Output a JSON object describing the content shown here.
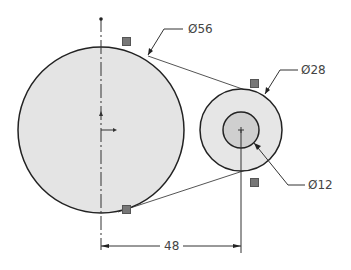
{
  "drawing": {
    "type": "sketch-dimensions",
    "colors": {
      "line": "#222222",
      "fill_large": "#e4e4e4",
      "fill_small": "#e4e4e4",
      "fill_inner": "#cfcfcf",
      "dimension": "#333333",
      "text": "#444444",
      "badge": "#777777"
    },
    "circles": [
      {
        "name": "large-pulley",
        "cx": 101,
        "cy": 130,
        "r": 83,
        "dim_label": "Ø56"
      },
      {
        "name": "small-pulley",
        "cx": 241,
        "cy": 130,
        "r": 41,
        "dim_label": "Ø28"
      },
      {
        "name": "hub-hole",
        "cx": 241,
        "cy": 130,
        "r": 18,
        "dim_label": "Ø12"
      }
    ],
    "dimensions": {
      "d56": {
        "text": "Ø56"
      },
      "d28": {
        "text": "Ø28"
      },
      "d12": {
        "text": "Ø12"
      },
      "center_distance": {
        "text": "48"
      }
    },
    "relation_badges": [
      {
        "x": 122,
        "y": 37
      },
      {
        "x": 250,
        "y": 79
      },
      {
        "x": 122,
        "y": 205
      },
      {
        "x": 250,
        "y": 178
      }
    ]
  }
}
